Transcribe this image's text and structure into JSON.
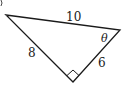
{
  "figure": {
    "type": "right-triangle",
    "labels": {
      "hypotenuse": "10",
      "left_leg": "8",
      "right_leg": "6",
      "angle": "θ"
    },
    "right_angle_marker": true,
    "stroke_color": "#1a1a1a"
  }
}
